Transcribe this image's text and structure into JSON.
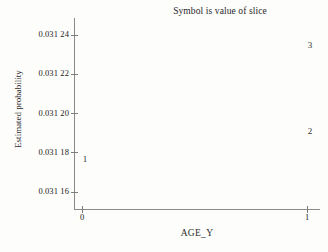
{
  "chart_data": {
    "type": "scatter",
    "title": "Symbol is value of slice",
    "xlabel": "AGE_Y",
    "ylabel": "Estimated probability",
    "grid": false,
    "legend": "none",
    "xlim": [
      0,
      1
    ],
    "ylim": [
      0.03115,
      0.031252
    ],
    "x_ticks": [
      {
        "value": 0,
        "label": "0"
      },
      {
        "value": 1,
        "label": "1"
      }
    ],
    "y_ticks": [
      {
        "value": 0.03124,
        "label": "0.031 24"
      },
      {
        "value": 0.03122,
        "label": "0.031 22"
      },
      {
        "value": 0.0312,
        "label": "0.031 20"
      },
      {
        "value": 0.03118,
        "label": "0.031 18"
      },
      {
        "value": 0.03116,
        "label": "0.031 16"
      }
    ],
    "point_label_note": "Symbol is value of slice",
    "points": [
      {
        "label": "1",
        "x": 0,
        "y": 0.031177,
        "slice": 1
      },
      {
        "label": "2",
        "x": 1,
        "y": 0.031191,
        "slice": 2
      },
      {
        "label": "3",
        "x": 1,
        "y": 0.031235,
        "slice": 3
      }
    ]
  },
  "colors": {
    "background": "#fdfdfb",
    "axis": "#8a8a8a",
    "text": "#2b2b2b",
    "symbol": "#2f2f2f"
  }
}
